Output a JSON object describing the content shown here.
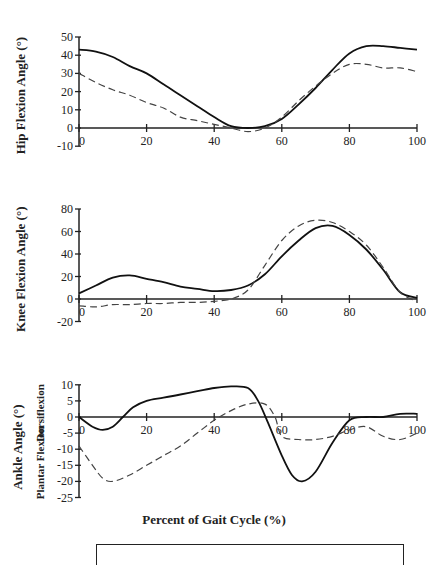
{
  "chart_data": [
    {
      "type": "line",
      "ylabel": "Hip Flexion Angle (°)",
      "xlabel": "",
      "xlim": [
        0,
        100
      ],
      "ylim": [
        -10,
        50
      ],
      "xticks": [
        0,
        20,
        40,
        60,
        80,
        100
      ],
      "xtick_labels": [
        "0",
        "20",
        "40",
        "60",
        "80",
        "100"
      ],
      "yticks": [
        -10,
        0,
        10,
        20,
        30,
        40,
        50
      ],
      "grid": false,
      "series": [
        {
          "name": "solid",
          "style": "solid",
          "x": [
            0,
            5,
            10,
            15,
            20,
            25,
            30,
            35,
            40,
            45,
            50,
            55,
            60,
            65,
            70,
            75,
            80,
            85,
            90,
            95,
            100
          ],
          "values": [
            43,
            42,
            39,
            34,
            30,
            24,
            18,
            12,
            6,
            1,
            0,
            1,
            5,
            13,
            22,
            32,
            41,
            45,
            45,
            44,
            43
          ]
        },
        {
          "name": "dashed",
          "style": "dashed",
          "x": [
            0,
            5,
            10,
            15,
            20,
            25,
            30,
            35,
            40,
            45,
            50,
            55,
            60,
            65,
            70,
            75,
            80,
            85,
            90,
            95,
            100
          ],
          "values": [
            30,
            25,
            21,
            18,
            14,
            11,
            6,
            4,
            2,
            0,
            -2,
            0,
            6,
            15,
            23,
            30,
            35,
            35,
            33,
            33,
            31
          ]
        }
      ]
    },
    {
      "type": "line",
      "ylabel": "Knee Flexion Angle (°)",
      "xlabel": "",
      "xlim": [
        0,
        100
      ],
      "ylim": [
        -20,
        80
      ],
      "xticks": [
        0,
        20,
        40,
        60,
        80,
        100
      ],
      "xtick_labels": [
        "0",
        "20",
        "40",
        "60",
        "80",
        "100"
      ],
      "yticks": [
        -20,
        0,
        20,
        40,
        60,
        80
      ],
      "grid": false,
      "series": [
        {
          "name": "solid",
          "style": "solid",
          "x": [
            0,
            5,
            10,
            15,
            20,
            25,
            30,
            35,
            40,
            45,
            50,
            55,
            60,
            65,
            70,
            75,
            80,
            85,
            90,
            95,
            100
          ],
          "values": [
            5,
            12,
            19,
            21,
            18,
            15,
            11,
            9,
            7,
            8,
            12,
            22,
            38,
            52,
            63,
            65,
            57,
            44,
            26,
            6,
            1
          ]
        },
        {
          "name": "dashed",
          "style": "dashed",
          "x": [
            0,
            5,
            10,
            15,
            20,
            25,
            30,
            35,
            40,
            45,
            50,
            55,
            60,
            65,
            70,
            75,
            80,
            85,
            90,
            95,
            100
          ],
          "values": [
            -6,
            -7,
            -5,
            -5,
            -4,
            -4,
            -3,
            -3,
            -2,
            0,
            8,
            30,
            52,
            65,
            70,
            68,
            60,
            48,
            28,
            6,
            -2
          ]
        }
      ]
    },
    {
      "type": "line",
      "ylabel": "Ankle Angle (°)",
      "ylabel_secondary_top": "Dorsiflexion",
      "ylabel_secondary_bottom": "Plantar Flexion",
      "xlabel": "Percent of Gait Cycle (%)",
      "xlim": [
        0,
        100
      ],
      "ylim": [
        -25,
        10
      ],
      "xticks": [
        0,
        20,
        40,
        60,
        80,
        100
      ],
      "xtick_labels": [
        "0",
        "20",
        "40",
        "60",
        "80",
        "100"
      ],
      "yticks": [
        -25,
        -20,
        -15,
        -10,
        -5,
        0,
        5,
        10
      ],
      "grid": false,
      "series": [
        {
          "name": "solid",
          "style": "solid",
          "x": [
            0,
            4,
            7,
            10,
            13,
            16,
            20,
            25,
            30,
            35,
            40,
            45,
            50,
            53,
            56,
            60,
            63,
            66,
            70,
            75,
            80,
            85,
            90,
            95,
            100
          ],
          "values": [
            0,
            -3,
            -4,
            -3,
            0,
            3,
            5,
            6,
            7,
            8,
            9,
            9.5,
            9,
            5,
            -2,
            -12,
            -18,
            -20,
            -17,
            -8,
            -1,
            0,
            0,
            1,
            1
          ]
        },
        {
          "name": "dashed",
          "style": "dashed",
          "x": [
            0,
            4,
            7,
            10,
            15,
            20,
            25,
            30,
            35,
            40,
            45,
            50,
            55,
            58,
            60,
            65,
            70,
            75,
            80,
            85,
            90,
            95,
            100
          ],
          "values": [
            -9,
            -15,
            -19,
            -20,
            -18,
            -15,
            -12,
            -9,
            -5,
            -1,
            2,
            4,
            4,
            0,
            -6,
            -7,
            -7,
            -6,
            -4,
            -3,
            -6,
            -7,
            -5
          ]
        }
      ]
    }
  ],
  "labels": {
    "hip_ylabel": "Hip Flexion Angle (°)",
    "knee_ylabel": "Knee Flexion Angle (°)",
    "ankle_ylabel": "Ankle Angle (°)",
    "ankle_dorsi": "Dorsiflexion",
    "ankle_plantar": "Plantar Flexion",
    "xlabel": "Percent of Gait Cycle (%)"
  },
  "ticks": {
    "hip_y": [
      "50",
      "40",
      "30",
      "20",
      "10",
      "0",
      "-10"
    ],
    "knee_y": [
      "80",
      "60",
      "40",
      "20",
      "0",
      "-20"
    ],
    "ankle_y": [
      "10",
      "5",
      "0",
      "-5",
      "-10",
      "-15",
      "-20",
      "-25"
    ],
    "x": [
      "0",
      "20",
      "40",
      "60",
      "80",
      "100"
    ]
  }
}
